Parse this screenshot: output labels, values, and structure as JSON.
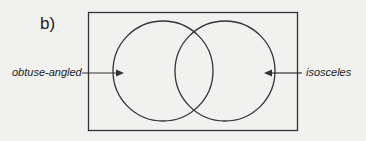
{
  "part_label": "b)",
  "diagram": {
    "type": "venn",
    "sets": [
      {
        "name": "obtuse-angled",
        "side": "left"
      },
      {
        "name": "isosceles",
        "side": "right"
      }
    ]
  },
  "colors": {
    "stroke": "#333333",
    "background": "#f1f1ef"
  }
}
